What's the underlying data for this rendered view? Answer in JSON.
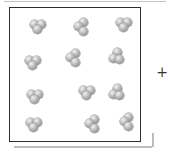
{
  "diagram": {
    "plus_sign": "+",
    "molecule_count": 12,
    "atoms_per_molecule": 3,
    "atom_diameter_px": 9,
    "colors": {
      "box_border": "#2e2e2e",
      "box_background": "#ffffff",
      "shadow": "#bdbdbd",
      "top_edge_line": "#c2c2c2",
      "atom_highlight": "#f2f2f2",
      "atom_mid": "#c4c4c4",
      "atom_body": "#a2a2a2",
      "atom_shade": "#828282",
      "atom_outline": "#8f8f8f",
      "plus_color": "#333333"
    },
    "molecules": [
      {
        "x": 38,
        "y": 27,
        "atoms": [
          [
            -3.6,
            -2.4
          ],
          [
            3.4,
            -3.0
          ],
          [
            -0.2,
            2.6
          ]
        ]
      },
      {
        "x": 82,
        "y": 27,
        "atoms": [
          [
            1.2,
            -4.8
          ],
          [
            -3.2,
            -0.2
          ],
          [
            1.6,
            4.6
          ]
        ]
      },
      {
        "x": 124,
        "y": 25,
        "atoms": [
          [
            -3.6,
            -2.4
          ],
          [
            3.4,
            -3.0
          ],
          [
            -0.2,
            2.6
          ]
        ]
      },
      {
        "x": 33,
        "y": 63,
        "atoms": [
          [
            -3.6,
            -2.4
          ],
          [
            3.4,
            -3.0
          ],
          [
            -0.2,
            2.6
          ]
        ]
      },
      {
        "x": 74,
        "y": 58,
        "atoms": [
          [
            1.2,
            -4.8
          ],
          [
            -3.2,
            -0.2
          ],
          [
            1.6,
            4.6
          ]
        ]
      },
      {
        "x": 117,
        "y": 57,
        "atoms": [
          [
            0.8,
            -4.2
          ],
          [
            -3.6,
            1.0
          ],
          [
            2.6,
            2.0
          ]
        ]
      },
      {
        "x": 35,
        "y": 97,
        "atoms": [
          [
            -3.6,
            -2.4
          ],
          [
            3.4,
            -3.0
          ],
          [
            -0.2,
            2.6
          ]
        ]
      },
      {
        "x": 87,
        "y": 93,
        "atoms": [
          [
            -3.6,
            -2.4
          ],
          [
            3.4,
            -3.0
          ],
          [
            -0.2,
            2.6
          ]
        ]
      },
      {
        "x": 117,
        "y": 93,
        "atoms": [
          [
            0.8,
            -4.2
          ],
          [
            -3.6,
            1.0
          ],
          [
            2.6,
            2.0
          ]
        ]
      },
      {
        "x": 34,
        "y": 125,
        "atoms": [
          [
            -3.6,
            -2.4
          ],
          [
            3.4,
            -3.0
          ],
          [
            -0.2,
            2.6
          ]
        ]
      },
      {
        "x": 93,
        "y": 124,
        "atoms": [
          [
            1.2,
            -4.8
          ],
          [
            -3.2,
            -0.2
          ],
          [
            1.6,
            4.6
          ]
        ]
      },
      {
        "x": 127,
        "y": 122,
        "atoms": [
          [
            1.6,
            -5.0
          ],
          [
            -2.8,
            -0.2
          ],
          [
            1.8,
            4.4
          ]
        ]
      }
    ]
  }
}
